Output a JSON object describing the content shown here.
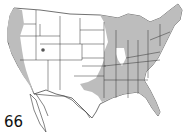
{
  "map": {
    "subject": "United States range map",
    "figure_number": "66",
    "colors": {
      "range_fill": "#bdbdbd",
      "land_fill": "#ffffff",
      "border": "#333333",
      "background": "#ffffff"
    },
    "shaded_regions": [
      "Pacific coast (Washington, Oregon, California)",
      "Northern Utah spot",
      "Eastern states east of the Plains",
      "Great Lakes region",
      "Southeastern states including Florida",
      "Eastern Texas / Oklahoma band"
    ],
    "unshaded_notable": [
      "Illinois",
      "Great Plains",
      "Mountain West",
      "Southwest"
    ]
  }
}
